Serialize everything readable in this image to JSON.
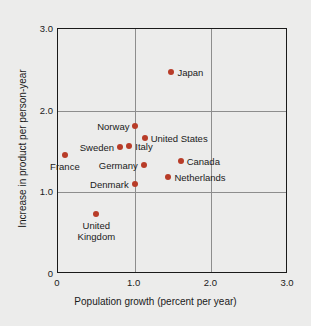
{
  "chart_data": {
    "type": "scatter",
    "title": "",
    "xlabel": "Population growth (percent per year)",
    "ylabel": "Increase in product per person-year",
    "xlim": [
      0,
      3.0
    ],
    "ylim": [
      0,
      3.0
    ],
    "xticks": [
      "0",
      "1.0",
      "2.0",
      "3.0"
    ],
    "xtick_values": [
      0,
      1.0,
      2.0,
      3.0
    ],
    "yticks": [
      "0",
      "1.0",
      "2.0",
      "3.0"
    ],
    "ytick_values": [
      0,
      1.0,
      2.0,
      3.0
    ],
    "grid": true,
    "legend": "none",
    "marker_color": "#b83c28",
    "points": [
      {
        "label": "Japan",
        "x": 1.48,
        "y": 2.47,
        "label_pos": "right"
      },
      {
        "label": "Norway",
        "x": 1.01,
        "y": 1.81,
        "label_pos": "left"
      },
      {
        "label": "United States",
        "x": 1.13,
        "y": 1.67,
        "label_pos": "right"
      },
      {
        "label": "Sweden",
        "x": 0.81,
        "y": 1.56,
        "label_pos": "left"
      },
      {
        "label": "Italy",
        "x": 0.93,
        "y": 1.57,
        "label_pos": "right"
      },
      {
        "label": "Canada",
        "x": 1.6,
        "y": 1.38,
        "label_pos": "right"
      },
      {
        "label": "France",
        "x": 0.09,
        "y": 1.46,
        "label_pos": "below"
      },
      {
        "label": "Germany",
        "x": 1.12,
        "y": 1.34,
        "label_pos": "left"
      },
      {
        "label": "Netherlands",
        "x": 1.44,
        "y": 1.19,
        "label_pos": "right"
      },
      {
        "label": "Denmark",
        "x": 1.0,
        "y": 1.1,
        "label_pos": "left"
      },
      {
        "label": "United Kingdom",
        "x": 0.5,
        "y": 0.74,
        "label_pos": "below"
      }
    ]
  }
}
